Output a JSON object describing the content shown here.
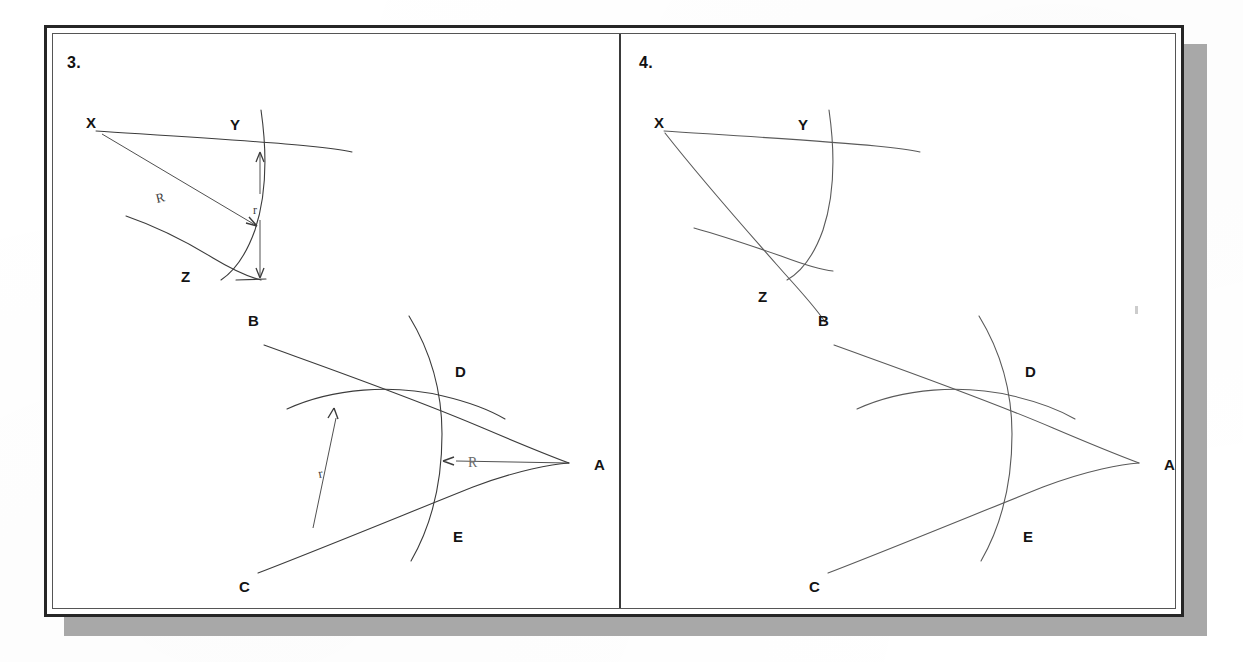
{
  "document": {
    "kind": "scanned-geometry-worksheet",
    "panels": [
      {
        "number_label": "3.",
        "figures": [
          {
            "name": "angle-XYZ-construction-with-radii",
            "vertex_label": "X",
            "point_labels": [
              "X",
              "Y",
              "Z"
            ],
            "annotations": [
              {
                "text": "R",
                "meaning": "radius-from-vertex"
              },
              {
                "text": "r",
                "meaning": "equal-arc-radius"
              }
            ]
          },
          {
            "name": "angle-BAC-construction-with-radii",
            "vertex_label": "A",
            "point_labels": [
              "B",
              "A",
              "C",
              "D",
              "E"
            ],
            "annotations": [
              {
                "text": "R",
                "meaning": "radius-from-vertex"
              },
              {
                "text": "r",
                "meaning": "equal-arc-radius"
              }
            ]
          }
        ]
      },
      {
        "number_label": "4.",
        "figures": [
          {
            "name": "angle-XYZ-construction-with-bisector",
            "vertex_label": "X",
            "point_labels": [
              "X",
              "Y",
              "Z"
            ],
            "annotations": []
          },
          {
            "name": "angle-BAC-construction-plain",
            "vertex_label": "A",
            "point_labels": [
              "B",
              "A",
              "C",
              "D",
              "E"
            ],
            "annotations": []
          }
        ]
      }
    ]
  },
  "panel3": {
    "number": "3.",
    "fig_top": {
      "label_X": "X",
      "label_Y": "Y",
      "label_Z": "Z",
      "label_R": "R",
      "label_r": "r"
    },
    "fig_bottom": {
      "label_B": "B",
      "label_A": "A",
      "label_C": "C",
      "label_D": "D",
      "label_E": "E",
      "label_R": "R",
      "label_r": "r"
    }
  },
  "panel4": {
    "number": "4.",
    "fig_top": {
      "label_X": "X",
      "label_Y": "Y",
      "label_Z": "Z"
    },
    "fig_bottom": {
      "label_B": "B",
      "label_A": "A",
      "label_C": "C",
      "label_D": "D",
      "label_E": "E"
    }
  },
  "colors": {
    "ink": "#3c3c3c",
    "label_ink": "#141414",
    "frame": "#262626",
    "inner_rule": "#555555",
    "shadow": "#a8a8a8",
    "paper": "#ffffff"
  }
}
